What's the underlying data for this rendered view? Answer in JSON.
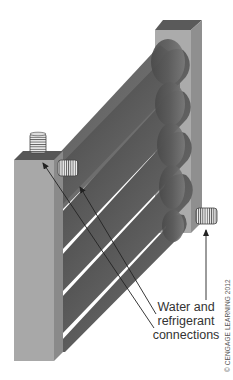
{
  "figure": {
    "label": {
      "lines": [
        "Water and",
        "refrigerant",
        "connections"
      ]
    },
    "copyright": "© CENGAGE LEARNING 2012",
    "components": [
      {
        "id": "left-header",
        "description": "Left vertical header block"
      },
      {
        "id": "right-header",
        "description": "Right vertical header block"
      },
      {
        "id": "tubes",
        "count": 5,
        "description": "Diagonal coaxial tubes connecting headers"
      },
      {
        "id": "connector-top",
        "description": "Threaded connection on top of left header"
      },
      {
        "id": "connector-side",
        "description": "Threaded connection on side of left header"
      },
      {
        "id": "connector-right",
        "description": "Threaded connection on side of right header"
      }
    ],
    "colors": {
      "header_front": "#a9a9a9",
      "header_side": "#8c8c8c",
      "header_top": "#5a5a5a",
      "tube_dark": "#4a4a4a",
      "tube_light": "#8a8a8a",
      "arrow": "#222222",
      "text": "#333333"
    }
  }
}
